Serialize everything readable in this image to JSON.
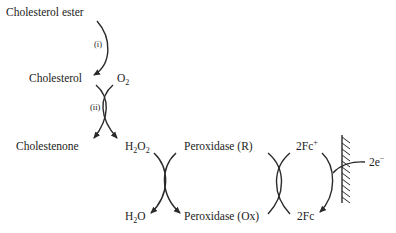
{
  "diagram": {
    "species": {
      "cholesterol_ester": "Cholesterol ester",
      "cholesterol": "Cholesterol",
      "o2": "O",
      "o2_sub": "2",
      "cholestenone": "Cholestenone",
      "h2o2_h": "H",
      "h2o2_sub1": "2",
      "h2o2_o": "O",
      "h2o2_sub2": "2",
      "h2o_h": "H",
      "h2o_sub": "2",
      "h2o_o": "O",
      "peroxidase_r": "Peroxidase (R)",
      "peroxidase_ox": "Peroxidase (Ox)",
      "fc_plus": "2Fc",
      "fc_plus_sup": "+",
      "fc": "2Fc",
      "electrons": "2e",
      "electrons_sup": "−"
    },
    "steps": {
      "step1": "(i)",
      "step2": "(ii)"
    },
    "colors": {
      "ink": "#222222",
      "background": "#ffffff"
    }
  }
}
